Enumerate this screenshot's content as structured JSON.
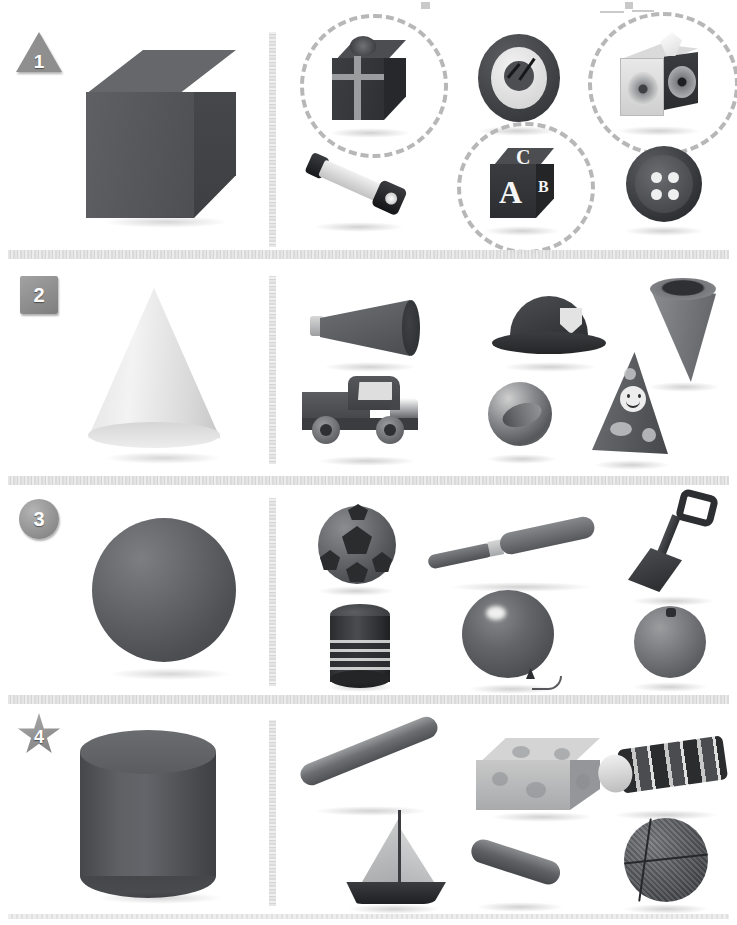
{
  "worksheet": {
    "title": "3D Shapes Matching Worksheet",
    "description": "Four numbered rows; each row shows a reference 3D solid and six real-world objects, with matching objects circled.",
    "background_color": "#ffffff",
    "accent_color": "#b7b7b7",
    "solid_color": "#4e5054",
    "divider_color": "#e0e0e0"
  },
  "rows": [
    {
      "number": "1",
      "marker_shape": "triangle",
      "reference_shape": {
        "name": "cube",
        "label": "Cube"
      },
      "objects": [
        {
          "name": "gift-box",
          "label": "Gift Box",
          "circled": true
        },
        {
          "name": "clock",
          "label": "Clock",
          "circled": false
        },
        {
          "name": "tissue-box",
          "label": "Tissue Box",
          "circled": true
        },
        {
          "name": "flashlight",
          "label": "Flashlight",
          "circled": false
        },
        {
          "name": "alphabet-block",
          "label": "Alphabet Block",
          "circled": true
        },
        {
          "name": "button",
          "label": "Button",
          "circled": false
        }
      ],
      "block_letters": {
        "front": "A",
        "top": "C",
        "side": "B"
      }
    },
    {
      "number": "2",
      "marker_shape": "square",
      "reference_shape": {
        "name": "cone",
        "label": "Cone"
      },
      "objects": [
        {
          "name": "megaphone",
          "label": "Megaphone",
          "circled": false
        },
        {
          "name": "fire-hat",
          "label": "Fire Hat",
          "circled": false
        },
        {
          "name": "ice-cream-cone",
          "label": "Ice Cream Cone",
          "circled": false
        },
        {
          "name": "toy-truck",
          "label": "Toy Truck",
          "circled": false
        },
        {
          "name": "marble-ball",
          "label": "Marble Ball",
          "circled": false
        },
        {
          "name": "party-hat",
          "label": "Party Hat",
          "circled": false
        }
      ]
    },
    {
      "number": "3",
      "marker_shape": "circle",
      "reference_shape": {
        "name": "sphere",
        "label": "Sphere"
      },
      "objects": [
        {
          "name": "soccer-ball",
          "label": "Soccer Ball",
          "circled": false
        },
        {
          "name": "baseball-bat",
          "label": "Baseball Bat",
          "circled": false
        },
        {
          "name": "shovel",
          "label": "Shovel",
          "circled": false
        },
        {
          "name": "tin-can",
          "label": "Tin Can",
          "circled": false
        },
        {
          "name": "balloon",
          "label": "Balloon",
          "circled": false
        },
        {
          "name": "orange",
          "label": "Orange",
          "circled": false
        }
      ]
    },
    {
      "number": "4",
      "marker_shape": "star",
      "reference_shape": {
        "name": "cylinder",
        "label": "Cylinder"
      },
      "objects": [
        {
          "name": "baton-rod",
          "label": "Baton",
          "circled": false
        },
        {
          "name": "gift-box-2",
          "label": "Wrapped Box",
          "circled": false
        },
        {
          "name": "kaleidoscope",
          "label": "Kaleidoscope",
          "circled": false
        },
        {
          "name": "sailboat",
          "label": "Sailboat",
          "circled": false
        },
        {
          "name": "chalk-stick",
          "label": "Chalk",
          "circled": false
        },
        {
          "name": "basketball",
          "label": "Basketball",
          "circled": false
        }
      ]
    }
  ]
}
